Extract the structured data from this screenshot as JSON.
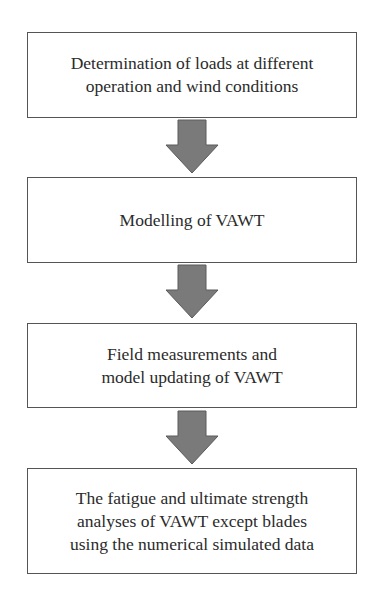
{
  "flowchart": {
    "steps": [
      {
        "lines": [
          "Determination of loads at different",
          "operation and wind conditions"
        ]
      },
      {
        "lines": [
          "Modelling of VAWT"
        ]
      },
      {
        "lines": [
          "Field measurements and",
          "model updating of VAWT"
        ]
      },
      {
        "lines": [
          "The fatigue and ultimate strength",
          "analyses of VAWT except blades",
          "using the numerical simulated data"
        ]
      }
    ],
    "arrow_color": "#7a7a7a",
    "border_color": "#555555"
  }
}
